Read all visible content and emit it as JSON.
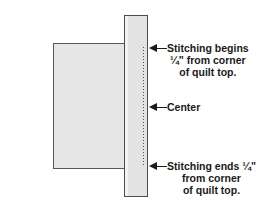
{
  "diagram": {
    "shapes": {
      "quilt_top": {
        "name": "quilt top",
        "fill": "#e6e6e6",
        "stroke": "#595959"
      },
      "border_strip": {
        "name": "border strip",
        "fill": "#e3e3e3",
        "stroke": "#4d4d4d"
      },
      "stitching_line": {
        "name": "stitching line",
        "style": "dotted",
        "color": "#4d4d4d"
      }
    },
    "annotations": [
      {
        "id": "stitching-begins",
        "arrow": "left-arrow-icon",
        "text": "Stitching begins\n¼\" from corner\nof quilt top.",
        "line1": "Stitching begins",
        "line2": "¼\" from corner",
        "line3": "of quilt top."
      },
      {
        "id": "center",
        "arrow": "left-arrow-icon",
        "text": "Center",
        "line1": "Center"
      },
      {
        "id": "stitching-ends",
        "arrow": "left-arrow-icon",
        "text": "Stitching ends ¼\"\nfrom corner\nof quilt top.",
        "line1": "Stitching ends ¼\"",
        "line2": "from corner",
        "line3": "of quilt top."
      }
    ]
  }
}
